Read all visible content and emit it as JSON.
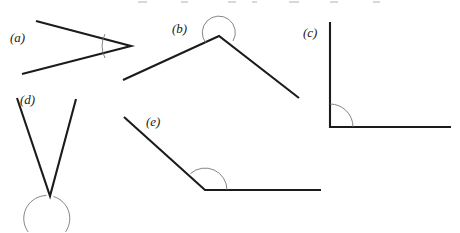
{
  "figure": {
    "kind": "geometry-angle-diagram",
    "background_color": "#ffffff",
    "line_color": "#1b1b1b",
    "arc_color": "#6f6f6f",
    "label_color": "#1a1a1a",
    "width": 460,
    "height": 232,
    "labels": {
      "a": "(a)",
      "b": "(b)",
      "c": "(c)",
      "d": "(d)",
      "e": "(e)"
    },
    "shapes": [
      {
        "id": "a",
        "label": "(a)",
        "label_x": 10,
        "label_y": 42,
        "vertex": [
          131,
          46
        ],
        "arm1_end": [
          36,
          21
        ],
        "arm2_end": [
          22,
          74
        ],
        "arc_kind": "minor-arc",
        "arc_path": "M 105 34 A 27 27 0 0 0 105 58",
        "angle_type": "acute"
      },
      {
        "id": "b",
        "label": "(b)",
        "label_x": 172,
        "label_y": 33,
        "vertex": [
          219,
          36
        ],
        "arm1_end": [
          123,
          80
        ],
        "arm2_end": [
          299,
          98
        ],
        "arc_kind": "reflex-arc",
        "arc_path": "M 205 44 A 16 16 0 1 1 232 42",
        "angle_type": "reflex"
      },
      {
        "id": "c",
        "label": "(c)",
        "label_x": 303,
        "label_y": 37,
        "vertex": [
          330,
          127
        ],
        "arm1_end": [
          330,
          22
        ],
        "arm2_end": [
          451,
          127
        ],
        "arc_kind": "quarter-arc",
        "arc_path": "M 330 104 A 23 23 0 0 1 353 127",
        "angle_type": "right"
      },
      {
        "id": "d",
        "label": "(d)",
        "label_x": 20,
        "label_y": 104,
        "vertex": [
          50,
          196
        ],
        "arm1_end": [
          17,
          98
        ],
        "arm2_end": [
          76,
          99
        ],
        "arc_kind": "near-full-circle",
        "arc_path": "M 54 197 A 23 23 0 1 1 46 196",
        "angle_type": "reflex"
      },
      {
        "id": "e",
        "label": "(e)",
        "label_x": 146,
        "label_y": 126,
        "vertex": [
          205,
          190
        ],
        "arm1_end": [
          124,
          117
        ],
        "arm2_end": [
          321,
          190
        ],
        "arc_kind": "major-arc",
        "arc_path": "M 227 190 A 22 22 0 0 0 190 174",
        "angle_type": "obtuse"
      }
    ]
  }
}
